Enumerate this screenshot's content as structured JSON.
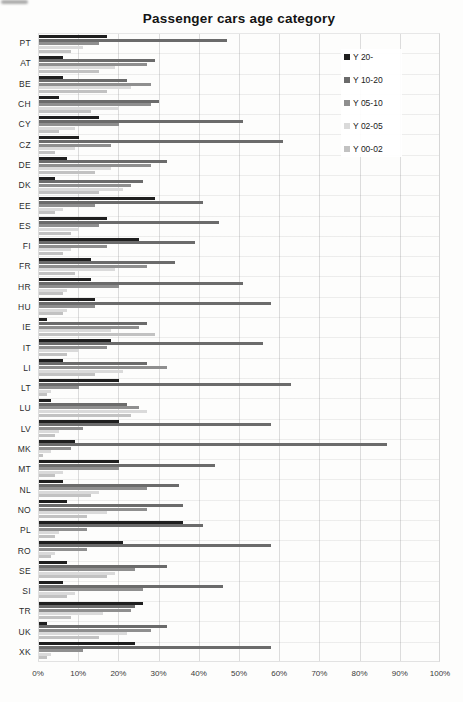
{
  "page": {
    "title": "Passenger cars age category"
  },
  "chart_data": {
    "type": "bar",
    "orientation": "horizontal",
    "title": "Passenger cars age category",
    "xlabel": "",
    "ylabel": "",
    "grid": true,
    "legend_position": "upper-right-inside",
    "x_axis": {
      "min": 0,
      "max": 100,
      "unit": "%",
      "ticks": [
        "0%",
        "10%",
        "20%",
        "30%",
        "40%",
        "50%",
        "60%",
        "70%",
        "80%",
        "90%",
        "100%"
      ]
    },
    "categories": [
      "PT",
      "AT",
      "BE",
      "CH",
      "CY",
      "CZ",
      "DE",
      "DK",
      "EE",
      "ES",
      "FI",
      "FR",
      "HR",
      "HU",
      "IE",
      "IT",
      "LI",
      "LT",
      "LU",
      "LV",
      "MK",
      "MT",
      "NL",
      "NO",
      "PL",
      "RO",
      "SE",
      "SI",
      "TR",
      "UK",
      "XK"
    ],
    "series": [
      {
        "name": "Y 20-",
        "color": "#1f1f1f",
        "values": [
          17,
          6,
          6,
          5,
          15,
          10,
          7,
          4,
          29,
          17,
          25,
          13,
          13,
          14,
          2,
          18,
          6,
          20,
          3,
          20,
          9,
          20,
          6,
          7,
          36,
          21,
          7,
          6,
          26,
          2,
          24
        ]
      },
      {
        "name": "Y 10-20",
        "color": "#6b6b6b",
        "values": [
          47,
          29,
          22,
          30,
          51,
          61,
          32,
          26,
          41,
          45,
          39,
          34,
          51,
          58,
          27,
          56,
          27,
          63,
          22,
          58,
          87,
          44,
          35,
          36,
          41,
          58,
          32,
          46,
          24,
          32,
          58
        ]
      },
      {
        "name": "Y 05-10",
        "color": "#8f8f8f",
        "values": [
          15,
          27,
          28,
          28,
          20,
          18,
          28,
          23,
          14,
          15,
          17,
          27,
          20,
          14,
          25,
          17,
          32,
          10,
          25,
          11,
          8,
          20,
          27,
          27,
          12,
          12,
          24,
          26,
          23,
          28,
          11
        ]
      },
      {
        "name": "Y 02-05",
        "color": "#dadada",
        "values": [
          11,
          19,
          23,
          20,
          9,
          9,
          18,
          21,
          6,
          10,
          8,
          19,
          7,
          7,
          18,
          10,
          21,
          3,
          27,
          5,
          3,
          6,
          15,
          17,
          5,
          4,
          19,
          9,
          16,
          22,
          3
        ]
      },
      {
        "name": "Y 00-02",
        "color": "#c2c2c2",
        "values": [
          8,
          15,
          17,
          13,
          5,
          4,
          14,
          15,
          4,
          8,
          6,
          9,
          6,
          6,
          29,
          7,
          14,
          2,
          23,
          4,
          1,
          4,
          13,
          12,
          4,
          3,
          17,
          7,
          8,
          15,
          2
        ]
      }
    ]
  }
}
